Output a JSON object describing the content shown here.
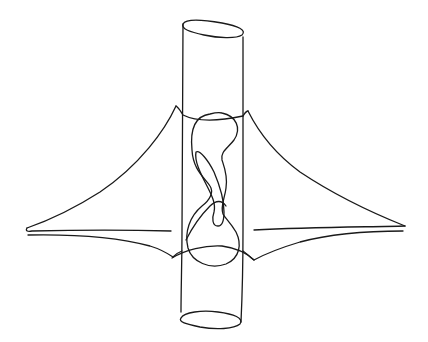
{
  "figure": {
    "title": "",
    "description": "Hand-drawn sketch of a vertical cylinder passing through a curved wing-shaped surface, with a knotted closed curve drawn inside the cylinder",
    "stroke_color": "#1a1a1a",
    "background": "#ffffff",
    "elements": [
      {
        "name": "cylinder",
        "kind": "tube",
        "left_x": 182,
        "right_x": 243,
        "top_y": 28,
        "bottom_y": 321
      },
      {
        "name": "left-wing",
        "kind": "cusped-sheet",
        "peak": [
          176,
          106
        ],
        "tip": [
          27,
          228
        ],
        "bottom": [
          173,
          257
        ]
      },
      {
        "name": "right-wing",
        "kind": "cusped-sheet",
        "peak": [
          248,
          111
        ],
        "tip": [
          405,
          226
        ],
        "bottom": [
          254,
          260
        ]
      },
      {
        "name": "knot-curve",
        "kind": "closed-curve",
        "region": [
          185,
          112,
          240,
          268
        ]
      }
    ]
  }
}
